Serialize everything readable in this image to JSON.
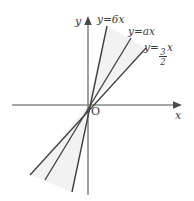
{
  "figure": {
    "type": "coordinate-plane-line-graph",
    "background_color": "#ffffff",
    "axis_color": "#8a8a8a",
    "line_color": "#3f3f3f",
    "text_color": "#3b3b3b",
    "shade_color": "#f0f0f0",
    "axes": {
      "x_label": "x",
      "y_label": "y",
      "origin_label": "O",
      "origin_px": {
        "x": 88,
        "y": 105
      },
      "x_axis_px": {
        "x1": 12,
        "y1": 105,
        "x2": 182,
        "y2": 105
      },
      "y_axis_px": {
        "x1": 88,
        "y1": 195,
        "x2": 88,
        "y2": 18
      },
      "arrowheads": [
        "x-positive",
        "y-positive"
      ]
    },
    "lines": [
      {
        "id": "line-steep",
        "label": "y=6x",
        "slope": 6,
        "label_text_parts": {
          "lhs": "y",
          "eq": "=",
          "coef": "6",
          "var": "x"
        },
        "start_px": {
          "x": 72,
          "y": 192
        },
        "end_px": {
          "x": 107,
          "y": 26
        }
      },
      {
        "id": "line-middle",
        "label": "y=ax",
        "slope": "a",
        "label_text_parts": {
          "lhs": "y",
          "eq": "=",
          "coef": "a",
          "var": "x"
        },
        "start_px": {
          "x": 45,
          "y": 180
        },
        "end_px": {
          "x": 131,
          "y": 38
        }
      },
      {
        "id": "line-shallow",
        "label": "y=3/2 x",
        "slope": 1.5,
        "label_text_parts": {
          "lhs": "y",
          "eq": "=",
          "num": "3",
          "den": "2",
          "var": "x"
        },
        "start_px": {
          "x": 30,
          "y": 175
        },
        "end_px": {
          "x": 146,
          "y": 48
        }
      }
    ],
    "shaded_region": {
      "description": "faint wedge between steepest and shallowest lines through origin",
      "color": "#f2f2f2"
    }
  }
}
